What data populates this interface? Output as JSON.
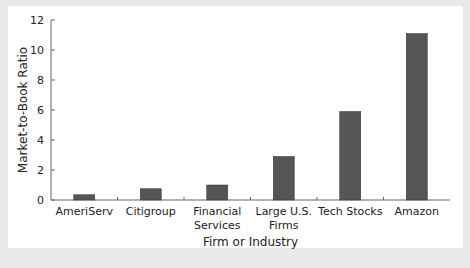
{
  "chart_data": {
    "type": "bar",
    "title": "",
    "xlabel": "Firm or Industry",
    "ylabel": "Market-to-Book Ratio",
    "ylim": [
      0,
      12
    ],
    "yticks": [
      0,
      2,
      4,
      6,
      8,
      10,
      12
    ],
    "categories": [
      "AmeriServ",
      "Citigroup",
      "Financial Services",
      "Large U.S. Firms",
      "Tech Stocks",
      "Amazon"
    ],
    "category_lines": [
      [
        "AmeriServ"
      ],
      [
        "Citigroup"
      ],
      [
        "Financial",
        "Services"
      ],
      [
        "Large U.S.",
        "Firms"
      ],
      [
        "Tech Stocks"
      ],
      [
        "Amazon"
      ]
    ],
    "values": [
      0.35,
      0.75,
      1.0,
      2.9,
      5.9,
      11.1
    ],
    "bar_color": "#555555",
    "grid": false
  }
}
